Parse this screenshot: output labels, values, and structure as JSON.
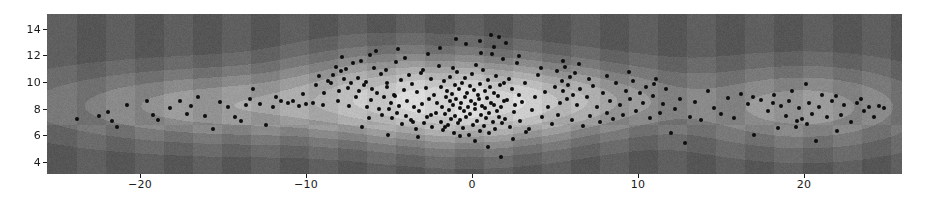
{
  "figure": {
    "background_color": "#ffffff",
    "plot_left": 47,
    "plot_top": 14,
    "plot_width": 855,
    "plot_height": 160
  },
  "axes": {
    "x_ticks": [
      -20,
      -10,
      0,
      10,
      20
    ],
    "x_tick_labels": [
      "−20",
      "−10",
      "0",
      "10",
      "20"
    ],
    "y_ticks": [
      4,
      6,
      8,
      10,
      12,
      14
    ],
    "y_tick_labels": [
      "4",
      "6",
      "8",
      "10",
      "12",
      "14"
    ],
    "tick_color": "#1a1a1a"
  },
  "chart_data": {
    "type": "scatter",
    "title": "",
    "xlabel": "",
    "ylabel": "",
    "xlim": [
      -25.6,
      25.9
    ],
    "ylim": [
      3.1,
      15.1
    ],
    "grid": false,
    "legend": null,
    "background_layer": {
      "type": "filled-contour-kde",
      "colormap": "greys",
      "n_levels": 8,
      "level_colors": [
        "#5f5f5f",
        "#6b6b6b",
        "#797979",
        "#8a8a8a",
        "#9c9c9c",
        "#aeaeae",
        "#bdbdbd",
        "#cecece",
        "#dcdcdc"
      ],
      "peaks": [
        {
          "x": 0.0,
          "y": 8.4,
          "weight": 1.0,
          "sx": 4.2,
          "sy": 1.9
        },
        {
          "x": -14.0,
          "y": 8.2,
          "weight": 0.46,
          "sx": 7.5,
          "sy": 1.7
        },
        {
          "x": 20.0,
          "y": 8.1,
          "weight": 0.42,
          "sx": 4.6,
          "sy": 1.9
        },
        {
          "x": 7.0,
          "y": 8.6,
          "weight": 0.38,
          "sx": 4.0,
          "sy": 1.6
        },
        {
          "x": -6.0,
          "y": 9.4,
          "weight": 0.35,
          "sx": 3.6,
          "sy": 1.9
        }
      ],
      "saddle_x": 15.3
    },
    "points_marker": "o",
    "points_color": "#0d0d0d",
    "points_size": 4,
    "n_points": 420,
    "points": [
      [
        -23.8,
        7.25
      ],
      [
        -21.9,
        7.75
      ],
      [
        -21.7,
        7.1
      ],
      [
        -21.4,
        6.6
      ],
      [
        -19.6,
        8.6
      ],
      [
        -18.9,
        7.15
      ],
      [
        -18.2,
        8.05
      ],
      [
        -17.6,
        8.55
      ],
      [
        -17.2,
        7.6
      ],
      [
        -16.9,
        8.2
      ],
      [
        -16.1,
        7.45
      ],
      [
        -15.6,
        6.45
      ],
      [
        -15.2,
        8.5
      ],
      [
        -14.7,
        8.15
      ],
      [
        -14.3,
        7.4
      ],
      [
        -13.9,
        7.05
      ],
      [
        -13.6,
        8.25
      ],
      [
        -13.2,
        9.5
      ],
      [
        -12.8,
        8.35
      ],
      [
        -12.4,
        6.75
      ],
      [
        -12.0,
        8.1
      ],
      [
        -11.5,
        8.6
      ],
      [
        -11.1,
        8.45
      ],
      [
        -10.8,
        8.55
      ],
      [
        -10.4,
        8.2
      ],
      [
        -10.0,
        8.35
      ],
      [
        -9.6,
        8.4
      ],
      [
        -9.2,
        10.45
      ],
      [
        -9.0,
        8.3
      ],
      [
        -8.7,
        10.1
      ],
      [
        -8.5,
        9.9
      ],
      [
        -8.4,
        10.5
      ],
      [
        -8.2,
        11.15
      ],
      [
        -8.0,
        9.3
      ],
      [
        -7.9,
        10.8
      ],
      [
        -7.7,
        10.2
      ],
      [
        -7.6,
        11.0
      ],
      [
        -7.5,
        9.55
      ],
      [
        -7.3,
        9.95
      ],
      [
        -7.2,
        11.4
      ],
      [
        -7.0,
        8.9
      ],
      [
        -6.9,
        10.3
      ],
      [
        -6.8,
        9.35
      ],
      [
        -6.6,
        6.6
      ],
      [
        -6.5,
        9.75
      ],
      [
        -6.4,
        10.0
      ],
      [
        -6.2,
        7.3
      ],
      [
        -6.1,
        8.65
      ],
      [
        -6.0,
        9.45
      ],
      [
        -5.9,
        11.05
      ],
      [
        -5.8,
        12.3
      ],
      [
        -5.7,
        9.2
      ],
      [
        -5.6,
        8.0
      ],
      [
        -5.5,
        10.6
      ],
      [
        -5.4,
        7.55
      ],
      [
        -5.3,
        8.85
      ],
      [
        -5.2,
        10.9
      ],
      [
        -5.1,
        9.6
      ],
      [
        -5.0,
        7.95
      ],
      [
        -4.9,
        8.45
      ],
      [
        -4.8,
        7.3
      ],
      [
        -4.7,
        9.05
      ],
      [
        -4.6,
        11.5
      ],
      [
        -4.5,
        7.7
      ],
      [
        -4.4,
        8.2
      ],
      [
        -4.3,
        10.15
      ],
      [
        -4.2,
        6.85
      ],
      [
        -4.1,
        9.4
      ],
      [
        -4.0,
        7.45
      ],
      [
        -3.9,
        8.6
      ],
      [
        -3.8,
        10.5
      ],
      [
        -3.7,
        7.15
      ],
      [
        -3.6,
        9.85
      ],
      [
        -3.5,
        8.1
      ],
      [
        -3.4,
        6.5
      ],
      [
        -3.3,
        9.25
      ],
      [
        -3.2,
        7.85
      ],
      [
        -3.1,
        10.7
      ],
      [
        -3.0,
        8.35
      ],
      [
        -2.9,
        6.95
      ],
      [
        -2.8,
        9.55
      ],
      [
        -2.7,
        7.4
      ],
      [
        -2.6,
        8.75
      ],
      [
        -2.5,
        10.25
      ],
      [
        -2.4,
        6.6
      ],
      [
        -2.3,
        9.05
      ],
      [
        -2.2,
        7.7
      ],
      [
        -2.1,
        8.4
      ],
      [
        -2.0,
        11.2
      ],
      [
        -1.9,
        7.0
      ],
      [
        -1.85,
        9.65
      ],
      [
        -1.8,
        8.15
      ],
      [
        -1.75,
        6.4
      ],
      [
        -1.7,
        10.05
      ],
      [
        -1.6,
        7.6
      ],
      [
        -1.55,
        8.9
      ],
      [
        -1.5,
        9.35
      ],
      [
        -1.45,
        6.75
      ],
      [
        -1.4,
        7.9
      ],
      [
        -1.35,
        8.55
      ],
      [
        -1.3,
        10.4
      ],
      [
        -1.25,
        7.25
      ],
      [
        -1.2,
        9.1
      ],
      [
        -1.15,
        8.25
      ],
      [
        -1.1,
        6.2
      ],
      [
        -1.05,
        9.8
      ],
      [
        -1.0,
        7.45
      ],
      [
        -0.95,
        8.7
      ],
      [
        -0.9,
        10.75
      ],
      [
        -0.85,
        6.9
      ],
      [
        -0.8,
        9.5
      ],
      [
        -0.75,
        8.05
      ],
      [
        -0.7,
        7.15
      ],
      [
        -0.65,
        8.45
      ],
      [
        -0.6,
        9.95
      ],
      [
        -0.55,
        6.55
      ],
      [
        -0.5,
        7.8
      ],
      [
        -0.45,
        8.9
      ],
      [
        -0.4,
        10.3
      ],
      [
        -0.35,
        7.35
      ],
      [
        -0.3,
        9.2
      ],
      [
        -0.25,
        8.15
      ],
      [
        -0.2,
        6.05
      ],
      [
        -0.15,
        9.7
      ],
      [
        -0.1,
        7.6
      ],
      [
        -0.05,
        8.6
      ],
      [
        0.0,
        10.6
      ],
      [
        0.05,
        6.8
      ],
      [
        0.1,
        9.4
      ],
      [
        0.15,
        7.95
      ],
      [
        0.2,
        8.35
      ],
      [
        0.25,
        11.3
      ],
      [
        0.3,
        7.1
      ],
      [
        0.35,
        9.0
      ],
      [
        0.4,
        8.75
      ],
      [
        0.45,
        6.35
      ],
      [
        0.5,
        9.85
      ],
      [
        0.55,
        7.5
      ],
      [
        0.6,
        8.2
      ],
      [
        0.65,
        10.9
      ],
      [
        0.7,
        6.7
      ],
      [
        0.75,
        9.3
      ],
      [
        0.8,
        8.05
      ],
      [
        0.85,
        7.3
      ],
      [
        0.9,
        8.8
      ],
      [
        0.95,
        10.15
      ],
      [
        1.0,
        6.15
      ],
      [
        1.05,
        7.7
      ],
      [
        1.1,
        9.6
      ],
      [
        1.15,
        8.45
      ],
      [
        1.2,
        12.1
      ],
      [
        1.25,
        7.0
      ],
      [
        1.3,
        9.15
      ],
      [
        1.35,
        8.3
      ],
      [
        1.4,
        6.5
      ],
      [
        1.45,
        10.45
      ],
      [
        1.5,
        7.85
      ],
      [
        1.55,
        8.95
      ],
      [
        1.6,
        13.4
      ],
      [
        1.65,
        7.4
      ],
      [
        1.7,
        9.75
      ],
      [
        1.75,
        8.1
      ],
      [
        1.8,
        6.9
      ],
      [
        1.85,
        11.7
      ],
      [
        1.9,
        8.55
      ],
      [
        1.95,
        9.95
      ],
      [
        2.0,
        7.2
      ],
      [
        2.1,
        8.65
      ],
      [
        2.2,
        10.2
      ],
      [
        2.3,
        6.6
      ],
      [
        2.4,
        9.45
      ],
      [
        2.5,
        7.75
      ],
      [
        2.6,
        8.25
      ],
      [
        2.7,
        11.45
      ],
      [
        2.8,
        9.05
      ],
      [
        2.9,
        7.05
      ],
      [
        3.0,
        8.5
      ],
      [
        3.2,
        9.9
      ],
      [
        3.4,
        6.45
      ],
      [
        3.6,
        7.9
      ],
      [
        3.8,
        8.85
      ],
      [
        4.0,
        10.5
      ],
      [
        4.2,
        7.35
      ],
      [
        4.4,
        9.25
      ],
      [
        4.6,
        8.1
      ],
      [
        4.8,
        6.85
      ],
      [
        5.0,
        9.6
      ],
      [
        5.1,
        10.85
      ],
      [
        5.2,
        7.55
      ],
      [
        5.3,
        8.4
      ],
      [
        5.4,
        10.1
      ],
      [
        5.5,
        9.35
      ],
      [
        5.6,
        11.1
      ],
      [
        5.7,
        8.7
      ],
      [
        5.8,
        9.8
      ],
      [
        5.9,
        10.35
      ],
      [
        6.0,
        7.15
      ],
      [
        6.1,
        9.05
      ],
      [
        6.2,
        10.65
      ],
      [
        6.3,
        8.25
      ],
      [
        6.5,
        9.5
      ],
      [
        6.7,
        6.7
      ],
      [
        6.9,
        8.9
      ],
      [
        7.1,
        7.45
      ],
      [
        7.3,
        9.7
      ],
      [
        7.5,
        8.15
      ],
      [
        7.7,
        7.0
      ],
      [
        7.9,
        9.2
      ],
      [
        8.1,
        7.65
      ],
      [
        8.3,
        8.6
      ],
      [
        8.5,
        7.25
      ],
      [
        8.7,
        9.95
      ],
      [
        8.9,
        8.3
      ],
      [
        9.1,
        7.5
      ],
      [
        9.3,
        9.35
      ],
      [
        9.5,
        8.75
      ],
      [
        9.7,
        10.05
      ],
      [
        9.9,
        7.85
      ],
      [
        10.1,
        9.15
      ],
      [
        10.3,
        8.45
      ],
      [
        10.5,
        9.6
      ],
      [
        10.7,
        7.3
      ],
      [
        10.9,
        8.95
      ],
      [
        11.1,
        10.25
      ],
      [
        11.3,
        7.7
      ],
      [
        11.5,
        8.35
      ],
      [
        11.7,
        9.45
      ],
      [
        12.0,
        6.15
      ],
      [
        12.2,
        7.95
      ],
      [
        12.5,
        8.7
      ],
      [
        12.8,
        5.4
      ],
      [
        13.1,
        7.4
      ],
      [
        13.4,
        8.5
      ],
      [
        13.8,
        7.15
      ],
      [
        14.2,
        9.35
      ],
      [
        14.6,
        8.05
      ],
      [
        15.0,
        7.6
      ],
      [
        15.4,
        8.8
      ],
      [
        15.8,
        7.3
      ],
      [
        16.2,
        9.1
      ],
      [
        16.6,
        8.35
      ],
      [
        17.0,
        6.05
      ],
      [
        17.4,
        8.65
      ],
      [
        17.8,
        7.85
      ],
      [
        18.2,
        9.05
      ],
      [
        18.6,
        8.2
      ],
      [
        18.9,
        7.45
      ],
      [
        19.1,
        8.55
      ],
      [
        19.3,
        9.3
      ],
      [
        19.5,
        6.6
      ],
      [
        19.7,
        8.05
      ],
      [
        19.9,
        7.2
      ],
      [
        20.1,
        9.85
      ],
      [
        20.3,
        8.4
      ],
      [
        20.5,
        7.6
      ],
      [
        20.7,
        5.55
      ],
      [
        20.9,
        8.15
      ],
      [
        21.1,
        9.0
      ],
      [
        21.4,
        7.35
      ],
      [
        21.7,
        8.6
      ],
      [
        22.0,
        6.35
      ],
      [
        22.4,
        8.25
      ],
      [
        22.8,
        7.0
      ],
      [
        23.2,
        8.45
      ],
      [
        23.6,
        7.8
      ],
      [
        23.9,
        8.1
      ],
      [
        24.2,
        7.35
      ],
      [
        24.5,
        8.2
      ],
      [
        24.8,
        8.05
      ],
      [
        -8.9,
        9.2
      ],
      [
        -8.1,
        8.6
      ],
      [
        -7.4,
        8.2
      ],
      [
        -6.7,
        11.6
      ],
      [
        -6.3,
        8.15
      ],
      [
        -5.15,
        9.9
      ],
      [
        -4.65,
        8.95
      ],
      [
        -4.05,
        11.8
      ],
      [
        -3.55,
        7.0
      ],
      [
        -2.95,
        10.9
      ],
      [
        -2.45,
        7.55
      ],
      [
        -1.95,
        12.55
      ],
      [
        -1.65,
        6.65
      ],
      [
        -1.15,
        11.05
      ],
      [
        -0.75,
        5.95
      ],
      [
        -0.35,
        12.85
      ],
      [
        0.15,
        5.6
      ],
      [
        0.55,
        12.2
      ],
      [
        0.95,
        5.15
      ],
      [
        1.35,
        12.65
      ],
      [
        1.75,
        4.35
      ],
      [
        2.05,
        12.95
      ],
      [
        2.45,
        5.75
      ],
      [
        2.85,
        11.95
      ],
      [
        3.25,
        6.25
      ],
      [
        -5.05,
        6.05
      ],
      [
        -3.25,
        5.85
      ],
      [
        -4.45,
        12.45
      ],
      [
        -2.65,
        12.1
      ],
      [
        0.45,
        13.1
      ],
      [
        1.15,
        13.55
      ],
      [
        -0.95,
        13.2
      ],
      [
        -7.85,
        11.85
      ],
      [
        -6.15,
        12.05
      ],
      [
        5.45,
        11.55
      ],
      [
        6.45,
        11.35
      ],
      [
        8.15,
        10.45
      ],
      [
        9.45,
        10.75
      ],
      [
        10.95,
        9.85
      ],
      [
        4.15,
        11.05
      ],
      [
        7.05,
        10.2
      ],
      [
        -9.4,
        9.75
      ],
      [
        -10.2,
        9.1
      ],
      [
        -11.8,
        8.9
      ],
      [
        -13.4,
        8.75
      ],
      [
        -16.5,
        8.85
      ],
      [
        -19.2,
        7.55
      ],
      [
        -20.8,
        8.3
      ],
      [
        -22.5,
        7.45
      ],
      [
        16.9,
        8.9
      ],
      [
        18.1,
        8.45
      ],
      [
        21.9,
        8.95
      ],
      [
        23.4,
        8.7
      ],
      [
        19.6,
        7.05
      ],
      [
        20.2,
        6.85
      ],
      [
        18.4,
        6.55
      ],
      [
        22.2,
        7.55
      ]
    ]
  }
}
